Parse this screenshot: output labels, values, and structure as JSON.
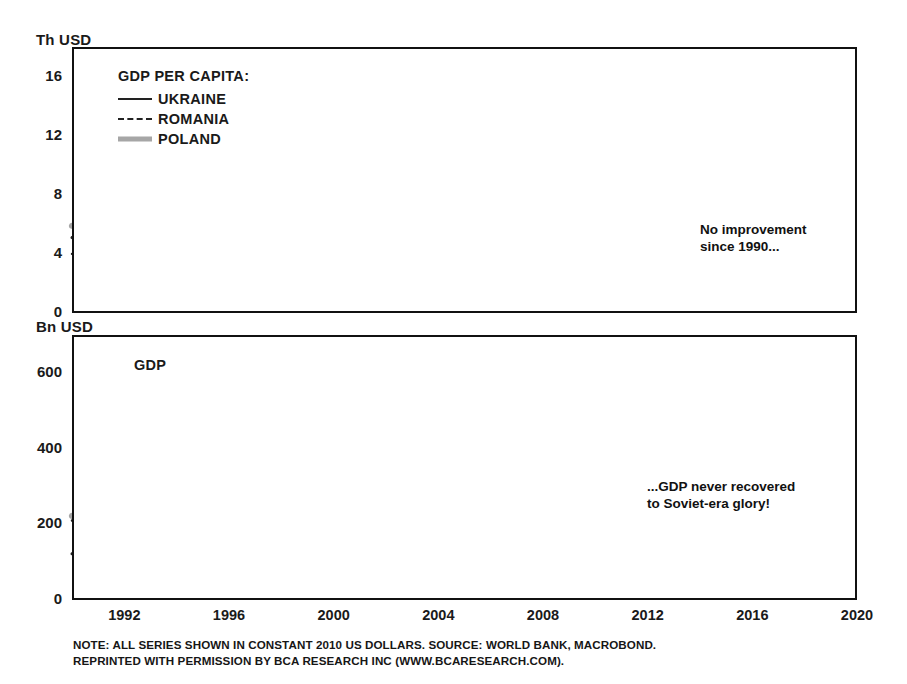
{
  "chart_data": [
    {
      "type": "line",
      "panel_id": "gdp-per-capita",
      "title": "GDP PER CAPITA:",
      "ylabel": "Th USD",
      "xlabel": "",
      "ylim": [
        0,
        18
      ],
      "yticks": [
        0,
        4,
        8,
        12,
        16
      ],
      "xlim": [
        1990,
        2020
      ],
      "xticks": [
        1992,
        1996,
        2000,
        2004,
        2008,
        2012,
        2016,
        2020
      ],
      "grid": false,
      "legend_position": "top-left",
      "x": [
        1990,
        1991,
        1992,
        1993,
        1994,
        1995,
        1996,
        1997,
        1998,
        1999,
        2000,
        2001,
        2002,
        2003,
        2004,
        2005,
        2006,
        2007,
        2008,
        2009,
        2010,
        2011,
        2012,
        2013,
        2014,
        2015,
        2016,
        2017,
        2018,
        2019
      ],
      "series": [
        {
          "name": "UKRAINE",
          "style": "solid",
          "color": "#222222",
          "values": [
            4.0,
            3.7,
            3.3,
            2.9,
            2.5,
            2.25,
            2.1,
            1.95,
            1.85,
            1.75,
            1.8,
            1.95,
            2.05,
            2.25,
            2.5,
            2.6,
            2.8,
            3.1,
            3.45,
            2.85,
            2.95,
            3.1,
            3.1,
            3.1,
            2.8,
            2.6,
            2.65,
            2.7,
            2.85,
            2.9
          ]
        },
        {
          "name": "ROMANIA",
          "style": "dashed",
          "color": "#222222",
          "values": [
            5.1,
            4.5,
            4.25,
            4.35,
            4.5,
            4.85,
            5.05,
            4.9,
            4.75,
            4.7,
            4.8,
            5.1,
            5.4,
            5.7,
            6.3,
            6.6,
            7.2,
            7.9,
            8.8,
            8.2,
            8.05,
            8.2,
            8.3,
            8.6,
            9.0,
            9.4,
            9.9,
            10.6,
            11.1,
            11.6
          ]
        },
        {
          "name": "POLAND",
          "style": "thick",
          "color": "#a6a6a6",
          "values": [
            5.9,
            5.55,
            5.7,
            5.95,
            6.25,
            6.7,
            7.1,
            7.6,
            8.0,
            8.4,
            8.8,
            8.9,
            9.1,
            9.5,
            10.0,
            10.4,
            11.1,
            11.9,
            12.5,
            12.7,
            13.2,
            13.8,
            14.0,
            14.2,
            14.7,
            15.3,
            15.7,
            16.2,
            16.5,
            16.6
          ]
        }
      ],
      "annotation": "No improvement\nsince 1990...",
      "annotation_marker": "circle-at-series-end"
    },
    {
      "type": "line",
      "panel_id": "gdp",
      "title": "GDP",
      "ylabel": "Bn USD",
      "xlabel": "",
      "ylim": [
        0,
        700
      ],
      "yticks": [
        0,
        200,
        400,
        600
      ],
      "xlim": [
        1990,
        2020
      ],
      "xticks": [
        1992,
        1996,
        2000,
        2004,
        2008,
        2012,
        2016,
        2020
      ],
      "grid": false,
      "legend_position": "none",
      "x": [
        1990,
        1991,
        1992,
        1993,
        1994,
        1995,
        1996,
        1997,
        1998,
        1999,
        2000,
        2001,
        2002,
        2003,
        2004,
        2005,
        2006,
        2007,
        2008,
        2009,
        2010,
        2011,
        2012,
        2013,
        2014,
        2015,
        2016,
        2017,
        2018,
        2019
      ],
      "series": [
        {
          "name": "UKRAINE",
          "style": "solid",
          "color": "#222222",
          "values": [
            210,
            195,
            175,
            155,
            132,
            118,
            110,
            103,
            97,
            93,
            95,
            103,
            108,
            118,
            130,
            136,
            146,
            160,
            168,
            140,
            147,
            153,
            154,
            155,
            140,
            127,
            130,
            133,
            137,
            138
          ]
        },
        {
          "name": "ROMANIA",
          "style": "dashed",
          "color": "#222222",
          "values": [
            122,
            105,
            100,
            102,
            106,
            113,
            117,
            113,
            110,
            108,
            111,
            118,
            124,
            130,
            143,
            150,
            163,
            178,
            196,
            182,
            178,
            181,
            182,
            187,
            193,
            200,
            210,
            222,
            228,
            232
          ]
        },
        {
          "name": "POLAND",
          "style": "thick",
          "color": "#a6a6a6",
          "values": [
            222,
            208,
            214,
            224,
            236,
            252,
            268,
            288,
            303,
            318,
            333,
            337,
            345,
            360,
            380,
            397,
            425,
            455,
            470,
            485,
            505,
            520,
            525,
            530,
            550,
            572,
            590,
            612,
            628,
            632
          ]
        }
      ],
      "annotation": "...GDP never recovered\nto Soviet-era glory!",
      "annotation_marker": "circle-at-series-end"
    }
  ],
  "panels": {
    "top": {
      "unit_label": "Th USD",
      "legend_title": "GDP PER CAPITA:",
      "legend_items": [
        {
          "label": "UKRAINE",
          "key": "solid"
        },
        {
          "label": "ROMANIA",
          "key": "dashed"
        },
        {
          "label": "POLAND",
          "key": "thick"
        }
      ],
      "ytick_labels": [
        "16",
        "12",
        "8",
        "4",
        "0"
      ],
      "callout_line1": "No improvement",
      "callout_line2": "since 1990..."
    },
    "bottom": {
      "unit_label": "Bn USD",
      "panel_title": "GDP",
      "ytick_labels": [
        "600",
        "400",
        "200",
        "0"
      ],
      "callout_line1": "...GDP never recovered",
      "callout_line2": "to Soviet-era glory!"
    }
  },
  "xaxis": {
    "tick_labels": [
      "1992",
      "1996",
      "2000",
      "2004",
      "2008",
      "2012",
      "2016",
      "2020"
    ]
  },
  "footnote": {
    "line1": "NOTE: ALL SERIES SHOWN IN CONSTANT 2010 US DOLLARS. SOURCE: WORLD BANK, MACROBOND.",
    "line2": "REPRINTED WITH PERMISSION BY BCA RESEARCH INC (WWW.BCARESEARCH.COM)."
  },
  "colors": {
    "ukraine": "#222222",
    "romania": "#222222",
    "poland": "#a6a6a6",
    "frame": "#111111",
    "text": "#1a1a1a"
  }
}
